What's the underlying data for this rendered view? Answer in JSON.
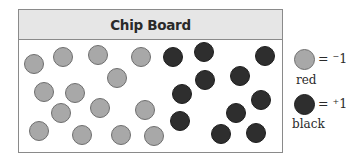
{
  "board": {
    "title": "Chip Board",
    "chips": [
      {
        "color": "red",
        "x": 34,
        "y": 64
      },
      {
        "color": "red",
        "x": 63,
        "y": 57
      },
      {
        "color": "red",
        "x": 98,
        "y": 55
      },
      {
        "color": "red",
        "x": 141,
        "y": 57
      },
      {
        "color": "red",
        "x": 117,
        "y": 78
      },
      {
        "color": "red",
        "x": 44,
        "y": 92
      },
      {
        "color": "red",
        "x": 75,
        "y": 93
      },
      {
        "color": "red",
        "x": 61,
        "y": 113
      },
      {
        "color": "red",
        "x": 100,
        "y": 108
      },
      {
        "color": "red",
        "x": 145,
        "y": 110
      },
      {
        "color": "red",
        "x": 39,
        "y": 131
      },
      {
        "color": "red",
        "x": 82,
        "y": 135
      },
      {
        "color": "red",
        "x": 121,
        "y": 135
      },
      {
        "color": "red",
        "x": 154,
        "y": 136
      },
      {
        "color": "black",
        "x": 173,
        "y": 57
      },
      {
        "color": "black",
        "x": 204,
        "y": 52
      },
      {
        "color": "black",
        "x": 265,
        "y": 56
      },
      {
        "color": "black",
        "x": 205,
        "y": 80
      },
      {
        "color": "black",
        "x": 240,
        "y": 76
      },
      {
        "color": "black",
        "x": 182,
        "y": 94
      },
      {
        "color": "black",
        "x": 261,
        "y": 100
      },
      {
        "color": "black",
        "x": 236,
        "y": 113
      },
      {
        "color": "black",
        "x": 180,
        "y": 121
      },
      {
        "color": "black",
        "x": 221,
        "y": 134
      },
      {
        "color": "black",
        "x": 256,
        "y": 133
      }
    ],
    "counts": {
      "red": 14,
      "black": 11
    }
  },
  "legend": {
    "red": {
      "equals": "= ",
      "sign": "−",
      "value": "1",
      "label": "red",
      "color": "#a8a8a8"
    },
    "black": {
      "equals": "= ",
      "sign": "+",
      "value": "1",
      "label": "black",
      "color": "#2e2e2e"
    }
  }
}
